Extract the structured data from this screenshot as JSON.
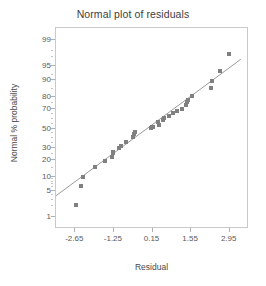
{
  "chart_data": {
    "type": "scatter",
    "title": "Normal plot of residuals",
    "xlabel": "Residual",
    "ylabel": "Normal % probability",
    "grid": false,
    "legend": null,
    "xlim": [
      -3.35,
      3.65
    ],
    "ylim_percent": [
      0.4,
      99.6
    ],
    "xticks": [
      -2.65,
      -1.25,
      0.15,
      1.55,
      2.95
    ],
    "xtick_labels": [
      "-2.65",
      "-1.25",
      "0.15",
      "1.55",
      "2.95"
    ],
    "yticks": [
      1,
      5,
      10,
      20,
      30,
      50,
      70,
      80,
      90,
      95,
      99
    ],
    "ytick_labels": [
      "1",
      "5",
      "10",
      "20",
      "30",
      "50",
      "70",
      "80",
      "90",
      "95",
      "99"
    ],
    "y_scale": "normal-probability",
    "point_color": "#808080",
    "line_color": "#9a9a9a",
    "frame_color": "#c9c9c9",
    "points": [
      {
        "x": -2.62,
        "p": 2.2
      },
      {
        "x": -2.45,
        "p": 6.3
      },
      {
        "x": -2.38,
        "p": 10.0
      },
      {
        "x": -1.92,
        "p": 15.2
      },
      {
        "x": -1.58,
        "p": 19.5
      },
      {
        "x": -1.33,
        "p": 22.5
      },
      {
        "x": -1.3,
        "p": 25.5
      },
      {
        "x": -1.27,
        "p": 27.0
      },
      {
        "x": -1.05,
        "p": 30.5
      },
      {
        "x": -1.0,
        "p": 32.5
      },
      {
        "x": -0.8,
        "p": 36.0
      },
      {
        "x": -0.55,
        "p": 41.5
      },
      {
        "x": -0.52,
        "p": 44.5
      },
      {
        "x": -0.48,
        "p": 46.5
      },
      {
        "x": 0.1,
        "p": 51.0
      },
      {
        "x": 0.13,
        "p": 51.5
      },
      {
        "x": 0.16,
        "p": 52.0
      },
      {
        "x": 0.34,
        "p": 56.5
      },
      {
        "x": 0.38,
        "p": 54.0
      },
      {
        "x": 0.52,
        "p": 58.5
      },
      {
        "x": 0.58,
        "p": 60.5
      },
      {
        "x": 0.76,
        "p": 63.0
      },
      {
        "x": 0.9,
        "p": 65.5
      },
      {
        "x": 1.05,
        "p": 68.0
      },
      {
        "x": 1.22,
        "p": 70.0
      },
      {
        "x": 1.38,
        "p": 73.5
      },
      {
        "x": 1.4,
        "p": 75.5
      },
      {
        "x": 1.43,
        "p": 77.5
      },
      {
        "x": 1.58,
        "p": 80.5
      },
      {
        "x": 2.28,
        "p": 85.5
      },
      {
        "x": 2.3,
        "p": 89.5
      },
      {
        "x": 2.58,
        "p": 93.5
      },
      {
        "x": 2.92,
        "p": 97.5
      }
    ],
    "reference_line": {
      "x_start": -3.35,
      "p_start": 3.8,
      "x_end": 3.35,
      "p_end": 96.6
    }
  }
}
